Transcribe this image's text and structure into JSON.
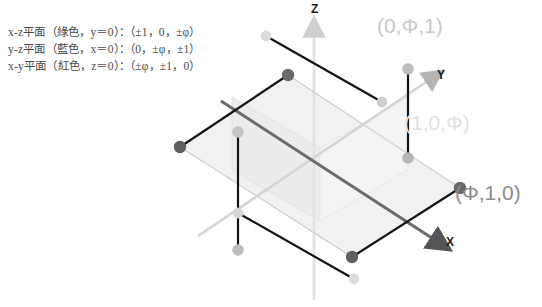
{
  "legend": {
    "lines": [
      "x-z平面（綠色，y＝0）：（±1，0，±φ）",
      "y-z平面（藍色，x＝0）：（0，±φ，±1）",
      "x-y平面（紅色，z＝0）：（±φ，±1，0）"
    ]
  },
  "axes": {
    "x_label": "X",
    "y_label": "Y",
    "z_label": "Z"
  },
  "coordinate_labels": [
    {
      "id": "0phi1",
      "text": "(0,Φ,1)",
      "color": "#c9c9c9"
    },
    {
      "id": "10phi",
      "text": "(1,0,Φ)",
      "color": "#e0e0e0"
    },
    {
      "id": "phi10",
      "text": "(Φ,1,0)",
      "color": "#8c8c8c"
    }
  ],
  "colors": {
    "background": "#ffffff",
    "text": "#4a4a4a",
    "axis_light": "#d8d8d8",
    "axis_medium": "#bdbdbd",
    "rect_dark_edge": "#1a1a1a",
    "rect_mid_edge": "#6e6e6e",
    "rect_light_edge": "#d0d0d0",
    "vertex_dark": "#5a5a5a",
    "vertex_mid": "#a8a8a8",
    "vertex_light": "#d4d4d4",
    "plane_fill_a": "#f2f2f2",
    "plane_fill_b": "#ededed",
    "plane_fill_c": "#f7f7f7"
  }
}
